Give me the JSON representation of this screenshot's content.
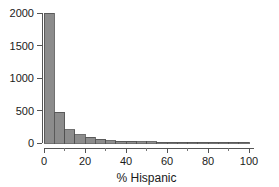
{
  "chart_data": {
    "type": "bar",
    "title": "",
    "subtitle": "",
    "xlabel": "% Hispanic",
    "ylabel": "",
    "xlim": [
      0,
      100
    ],
    "ylim": [
      0,
      2000
    ],
    "grid": false,
    "legend": null,
    "bin_width": 5,
    "bar_fill_color": "#8c8c8c",
    "bar_edge_color": "#4d4d4d",
    "axis_color": "#555555",
    "x_tick_labels": [
      "0",
      "20",
      "40",
      "60",
      "80",
      "100"
    ],
    "x_tick_values": [
      0,
      20,
      40,
      60,
      80,
      100
    ],
    "x_minor_tick_values": [
      10,
      30,
      50,
      70,
      90
    ],
    "y_tick_labels": [
      "0",
      "500",
      "1000",
      "1500",
      "2000"
    ],
    "y_tick_values": [
      0,
      500,
      1000,
      1500,
      2000
    ],
    "categories": [
      "0-5",
      "5-10",
      "10-15",
      "15-20",
      "20-25",
      "25-30",
      "30-35",
      "35-40",
      "40-45",
      "45-50",
      "50-55",
      "55-60",
      "60-65",
      "65-70",
      "70-75",
      "75-80",
      "80-85",
      "85-90",
      "90-95",
      "95-100"
    ],
    "bin_starts": [
      0,
      5,
      10,
      15,
      20,
      25,
      30,
      35,
      40,
      45,
      50,
      55,
      60,
      65,
      70,
      75,
      80,
      85,
      90,
      95
    ],
    "values": [
      2000,
      470,
      205,
      130,
      90,
      55,
      38,
      30,
      25,
      20,
      16,
      12,
      8,
      5,
      4,
      3,
      3,
      2,
      2,
      2
    ]
  },
  "figure": {
    "x_axis_title": "% Hispanic"
  }
}
